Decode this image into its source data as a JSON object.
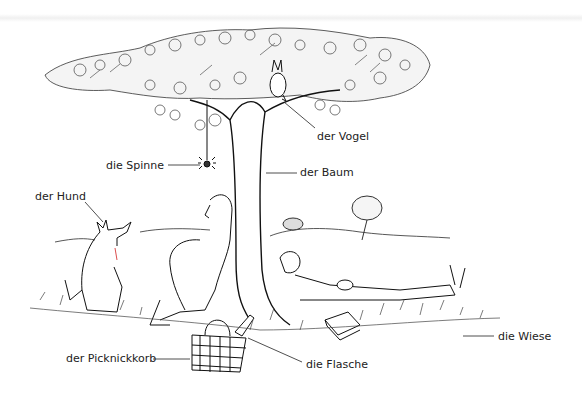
{
  "illustration": {
    "subject": "picnic under a tree",
    "labels": [
      {
        "text": "der Vogel",
        "x": 317,
        "y": 130
      },
      {
        "text": "die Spinne",
        "x": 106,
        "y": 159
      },
      {
        "text": "der Baum",
        "x": 300,
        "y": 166
      },
      {
        "text": "der Hund",
        "x": 35,
        "y": 190
      },
      {
        "text": "der Picknickkorb",
        "x": 66,
        "y": 349
      },
      {
        "text": "die Flasche",
        "x": 306,
        "y": 359
      },
      {
        "text": "die Wiese",
        "x": 498,
        "y": 330
      }
    ]
  }
}
